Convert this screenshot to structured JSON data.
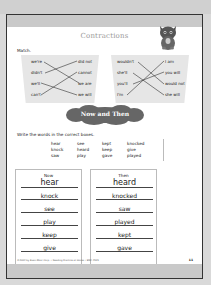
{
  "title": "Contractions",
  "match": {
    "label": "Match.",
    "left": {
      "contractions": [
        "we're",
        "didn't",
        "we'll",
        "can't"
      ],
      "expansions": [
        "did not",
        "cannot",
        "we are",
        "we will"
      ],
      "connections": [
        [
          0,
          2
        ],
        [
          1,
          0
        ],
        [
          2,
          3
        ],
        [
          3,
          1
        ]
      ]
    },
    "right": {
      "contractions": [
        "wouldn't",
        "she'll",
        "you'll",
        "I'm"
      ],
      "expansions": [
        "I am",
        "you will",
        "would not",
        "she will"
      ],
      "connections": [
        [
          0,
          2
        ],
        [
          1,
          3
        ],
        [
          2,
          1
        ],
        [
          3,
          0
        ]
      ]
    }
  },
  "section2": {
    "heading": "Now and Then",
    "instruction": "Write the words in the correct boxes.",
    "word_bank": [
      [
        "hear",
        "see",
        "kept",
        "knocked"
      ],
      [
        "knock",
        "heard",
        "keep",
        "give"
      ],
      [
        "saw",
        "play",
        "gave",
        "played"
      ]
    ],
    "now": {
      "heading": "Now",
      "words": [
        "hear",
        "knock",
        "see",
        "play",
        "keep",
        "give"
      ]
    },
    "then": {
      "heading": "Then",
      "words": [
        "heard",
        "knocked",
        "saw",
        "played",
        "kept",
        "gave"
      ]
    }
  },
  "footer": {
    "credit": "©2004 by Evan-Moor Corp. • Reading Practice at Home • EMC 4515",
    "page_number": "11"
  },
  "colors": {
    "page_band": "#c9c9c9",
    "match_box": "#e6e6e6",
    "cloud": "#666666",
    "title": "#999999"
  }
}
